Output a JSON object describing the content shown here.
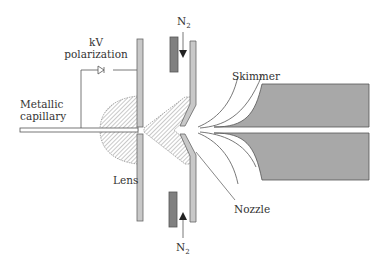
{
  "figure": {
    "type": "electrospray ion source schematic",
    "labels": {
      "kv_line1": "kV",
      "kv_line2": "polarization",
      "capillary_line1": "Metallic",
      "capillary_line2": "capillary",
      "lens": "Lens",
      "skimmer": "Skimmer",
      "nozzle": "Nozzle",
      "n2_top": "N",
      "n2_top_sub": "2",
      "n2_bottom": "N",
      "n2_bottom_sub": "2"
    },
    "colors": {
      "light_plate": "#c8c8c8",
      "dark_plate": "#808080",
      "skimmer_fill": "#a8a8a8",
      "line": "#555555",
      "hatch": "#777777"
    }
  }
}
